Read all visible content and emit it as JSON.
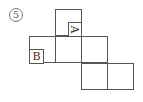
{
  "figure": {
    "number_label": "5",
    "number_style": "circled",
    "net_description": "cube net of six squares",
    "squares": [
      {
        "id": "top",
        "row": 0,
        "col": 1
      },
      {
        "id": "mid-left",
        "row": 1,
        "col": 0
      },
      {
        "id": "mid-center",
        "row": 1,
        "col": 1
      },
      {
        "id": "mid-right",
        "row": 1,
        "col": 2
      },
      {
        "id": "bottom-left",
        "row": 2,
        "col": 2
      },
      {
        "id": "bottom-right",
        "row": 2,
        "col": 3
      }
    ],
    "face_labels": {
      "a": {
        "text": "A",
        "rotation": "90deg clockwise",
        "face": "top"
      },
      "b": {
        "text": "B",
        "rotation": "none",
        "face": "mid-left"
      }
    },
    "colors": {
      "line": "#555555",
      "text": "#333333",
      "background": "#ffffff"
    }
  }
}
